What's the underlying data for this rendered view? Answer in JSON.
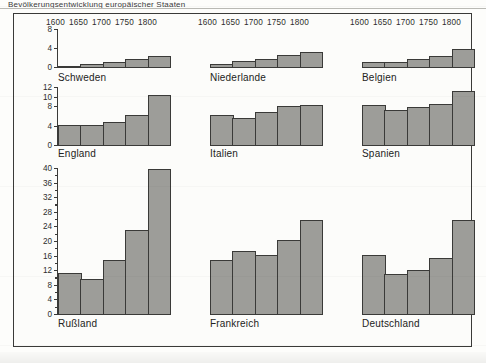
{
  "figure": {
    "title_fragment": "Bevölkerungsentwicklung europäischer Staaten",
    "background_color": "#fcfcfa",
    "frame_color": "#3a3a38",
    "bar_fill_color": "#9d9d99",
    "bar_edge_color": "#3a3a38"
  },
  "chart_data": [
    {
      "type": "bar",
      "title": "Schweden",
      "categories": [
        "1600",
        "1650",
        "1700",
        "1750",
        "1800"
      ],
      "values": [
        0.5,
        0.9,
        1.2,
        1.8,
        2.5
      ],
      "xlabel": "",
      "ylabel": "",
      "ylim": [
        0,
        8
      ],
      "yticks": [
        0,
        4,
        8
      ],
      "ytick_labels": [
        "0",
        "4",
        "8"
      ],
      "axis_visible": true,
      "grid": false,
      "legend": "none"
    },
    {
      "type": "bar",
      "title": "Niederlande",
      "categories": [
        "1600",
        "1650",
        "1700",
        "1750",
        "1800"
      ],
      "values": [
        0.8,
        1.4,
        2.0,
        2.8,
        3.3
      ],
      "xlabel": "",
      "ylabel": "",
      "ylim": [
        0,
        8
      ],
      "yticks": [],
      "ytick_labels": [],
      "axis_visible": false,
      "grid": false,
      "legend": "none"
    },
    {
      "type": "bar",
      "title": "Belgien",
      "categories": [
        "1600",
        "1650",
        "1700",
        "1750",
        "1800"
      ],
      "values": [
        1.3,
        1.3,
        1.9,
        2.6,
        4.0
      ],
      "xlabel": "",
      "ylabel": "",
      "ylim": [
        0,
        8
      ],
      "yticks": [],
      "ytick_labels": [],
      "axis_visible": false,
      "grid": false,
      "legend": "none"
    },
    {
      "type": "bar",
      "title": "England",
      "categories": [
        "1600",
        "1650",
        "1700",
        "1750",
        "1800"
      ],
      "values": [
        4.3,
        4.3,
        5.0,
        6.5,
        10.5
      ],
      "xlabel": "",
      "ylabel": "",
      "ylim": [
        0,
        12
      ],
      "yticks": [
        0,
        4,
        8,
        10,
        12
      ],
      "ytick_labels": [
        "0",
        "4",
        "8",
        "10",
        "12"
      ],
      "axis_visible": true,
      "grid": false,
      "legend": "none"
    },
    {
      "type": "bar",
      "title": "Italien",
      "categories": [
        "1600",
        "1650",
        "1700",
        "1750",
        "1800"
      ],
      "values": [
        6.5,
        5.8,
        7.0,
        8.3,
        8.5
      ],
      "xlabel": "",
      "ylabel": "",
      "ylim": [
        0,
        12
      ],
      "yticks": [],
      "ytick_labels": [],
      "axis_visible": false,
      "grid": false,
      "legend": "none"
    },
    {
      "type": "bar",
      "title": "Spanien",
      "categories": [
        "1600",
        "1650",
        "1700",
        "1750",
        "1800"
      ],
      "values": [
        8.5,
        7.5,
        8.0,
        8.6,
        11.3
      ],
      "xlabel": "",
      "ylabel": "",
      "ylim": [
        0,
        12
      ],
      "yticks": [],
      "ytick_labels": [],
      "axis_visible": false,
      "grid": false,
      "legend": "none"
    },
    {
      "type": "bar",
      "title": "Rußland",
      "categories": [
        "1600",
        "1650",
        "1700",
        "1750",
        "1800"
      ],
      "values": [
        11.5,
        10.0,
        15.0,
        23.2,
        40.0
      ],
      "xlabel": "",
      "ylabel": "",
      "ylim": [
        0,
        40
      ],
      "yticks": [
        0,
        4,
        8,
        12,
        16,
        20,
        24,
        28,
        32,
        36,
        40
      ],
      "ytick_labels": [
        "0",
        "4",
        "8",
        "12",
        "16",
        "20",
        "24",
        "28",
        "32",
        "36",
        "40"
      ],
      "axis_visible": true,
      "grid": false,
      "legend": "none"
    },
    {
      "type": "bar",
      "title": "Frankreich",
      "categories": [
        "1600",
        "1650",
        "1700",
        "1750",
        "1800"
      ],
      "values": [
        15.2,
        17.5,
        16.5,
        20.5,
        26.0
      ],
      "xlabel": "",
      "ylabel": "",
      "ylim": [
        0,
        40
      ],
      "yticks": [],
      "ytick_labels": [],
      "axis_visible": false,
      "grid": false,
      "legend": "none"
    },
    {
      "type": "bar",
      "title": "Deutschland",
      "categories": [
        "1600",
        "1650",
        "1700",
        "1750",
        "1800"
      ],
      "values": [
        16.5,
        11.2,
        12.4,
        15.6,
        26.0
      ],
      "xlabel": "",
      "ylabel": "",
      "ylim": [
        0,
        40
      ],
      "yticks": [],
      "ytick_labels": [],
      "axis_visible": false,
      "grid": false,
      "legend": "none"
    }
  ],
  "year_headers": [
    {
      "labels": [
        "1600",
        "1650",
        "1700",
        "1750",
        "1800"
      ]
    },
    {
      "labels": [
        "1600",
        "1650",
        "1700",
        "1750",
        "1800"
      ]
    },
    {
      "labels": [
        "1600",
        "1650",
        "1700",
        "1750",
        "1800"
      ]
    }
  ]
}
